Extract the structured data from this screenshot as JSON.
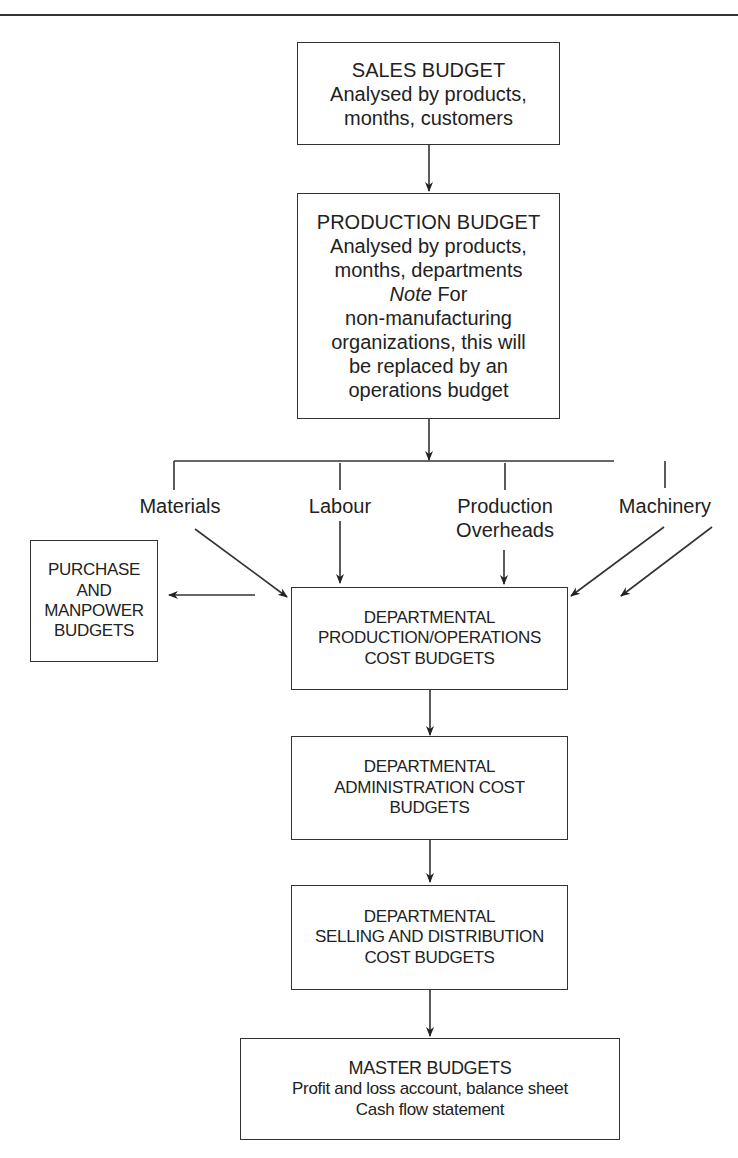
{
  "diagram": {
    "type": "flowchart",
    "boxes": {
      "sales": {
        "title": "SALES BUDGET",
        "lines": [
          "Analysed by products,",
          "months, customers"
        ]
      },
      "production": {
        "title": "PRODUCTION BUDGET",
        "lines": [
          "Analysed by products,",
          "months, departments"
        ],
        "note_label": "Note",
        "note_text_first": " For",
        "note_lines": [
          "non-manufacturing",
          "organizations, this will",
          "be replaced by an",
          "operations budget"
        ]
      },
      "purchase": {
        "lines": [
          "PURCHASE",
          "AND",
          "MANPOWER",
          "BUDGETS"
        ]
      },
      "dept_production": {
        "lines": [
          "DEPARTMENTAL",
          "PRODUCTION/OPERATIONS",
          "COST BUDGETS"
        ]
      },
      "dept_admin": {
        "lines": [
          "DEPARTMENTAL",
          "ADMINISTRATION COST",
          "BUDGETS"
        ]
      },
      "dept_selling": {
        "lines": [
          "DEPARTMENTAL",
          "SELLING AND DISTRIBUTION",
          "COST BUDGETS"
        ]
      },
      "master": {
        "title": "MASTER BUDGETS",
        "lines": [
          "Profit and loss account, balance sheet",
          "Cash flow statement"
        ]
      }
    },
    "inputs": {
      "materials": "Materials",
      "labour": "Labour",
      "production_overheads": [
        "Production",
        "Overheads"
      ],
      "machinery": "Machinery"
    },
    "edges": [
      {
        "from": "sales",
        "to": "production"
      },
      {
        "from": "production",
        "to": "inputs-bus"
      },
      {
        "from": "materials",
        "to": "dept_production"
      },
      {
        "from": "labour",
        "to": "dept_production"
      },
      {
        "from": "production_overheads",
        "to": "dept_production"
      },
      {
        "from": "machinery",
        "to": "dept_production"
      },
      {
        "from": "dept_production",
        "to": "purchase"
      },
      {
        "from": "dept_production",
        "to": "dept_admin"
      },
      {
        "from": "dept_admin",
        "to": "dept_selling"
      },
      {
        "from": "dept_selling",
        "to": "master"
      }
    ]
  }
}
